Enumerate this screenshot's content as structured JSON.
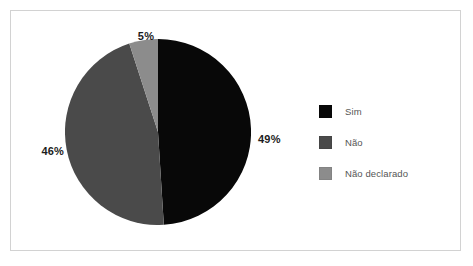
{
  "figure": {
    "background_color": "#ffffff",
    "border_color": "#d2d2d2"
  },
  "chart_data": {
    "type": "pie",
    "title": "",
    "subtitle": "",
    "xlabel": "",
    "ylabel": "",
    "grid": false,
    "legend_position": "right",
    "start_angle_deg": 0,
    "direction": "clockwise",
    "categories": [
      "Sim",
      "Não",
      "Não declarado"
    ],
    "values": [
      49,
      46,
      5
    ],
    "data_labels": [
      "49%",
      "46%",
      "5%"
    ],
    "colors": [
      "#080808",
      "#4a4a4a",
      "#8c8c8c"
    ],
    "slices": [
      {
        "label": "Sim",
        "value": 49,
        "display": "49%",
        "color": "#080808",
        "start_angle_deg": 0,
        "end_angle_deg": 176.4
      },
      {
        "label": "Não",
        "value": 46,
        "display": "46%",
        "color": "#4a4a4a",
        "start_angle_deg": 176.4,
        "end_angle_deg": 342.0
      },
      {
        "label": "Não declarado",
        "value": 5,
        "display": "5%",
        "color": "#8c8c8c",
        "start_angle_deg": 342.0,
        "end_angle_deg": 360.0
      }
    ]
  },
  "labels": {
    "sim_pct": "49%",
    "nao_pct": "46%",
    "nao_declarado_pct": "5%"
  },
  "legend": {
    "items": [
      {
        "label": "Sim",
        "color": "#080808"
      },
      {
        "label": "Não",
        "color": "#4a4a4a"
      },
      {
        "label": "Não declarado",
        "color": "#8c8c8c"
      }
    ]
  }
}
